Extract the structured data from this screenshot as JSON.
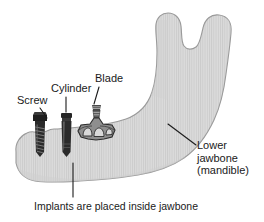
{
  "figure": {
    "background_color": "#ffffff",
    "bone_fill_color": "#d6d6d6",
    "bone_stroke_color": "#9a9a9a",
    "implant_dark_color": "#2b2b2b",
    "implant_mid_color": "#7a7a7a",
    "label_color": "#1a1a1a",
    "leader_line_color": "#1a1a1a"
  },
  "labels": {
    "screw": "Screw",
    "cylinder": "Cylinder",
    "blade": "Blade",
    "lower_jawbone_line1": "Lower",
    "lower_jawbone_line2": "jawbone",
    "lower_jawbone_line3": "(mandible)",
    "caption": "Implants are placed inside jawbone"
  },
  "parts": [
    {
      "name": "screw-implant",
      "label": "Screw",
      "description": "threaded cylindrical screw implant with flat head"
    },
    {
      "name": "cylinder-implant",
      "label": "Cylinder",
      "description": "smooth straight cylinder implant with collar"
    },
    {
      "name": "blade-implant",
      "label": "Blade",
      "description": "flat blade implant with post and three arched openings"
    },
    {
      "name": "mandible",
      "label": "Lower jawbone (mandible)",
      "description": "hatched gray mandible with ramus, condyle and coronoid process"
    }
  ]
}
